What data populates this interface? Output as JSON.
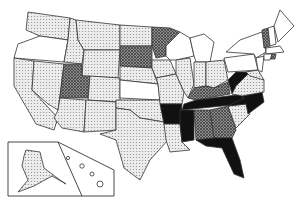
{
  "map": {
    "title": "",
    "legend": {
      "levels": [
        {
          "id": "none",
          "fill": "#ffffff"
        },
        {
          "id": "light",
          "fill": "url(#dots)"
        },
        {
          "id": "medium",
          "fill": "url(#hatch)"
        },
        {
          "id": "high",
          "fill": "#111111"
        }
      ]
    },
    "states": [
      {
        "id": "WA",
        "level": "light",
        "points": "28,12 70,18 68,40 40,36 26,30"
      },
      {
        "id": "OR",
        "level": "none",
        "points": "18,44 40,36 68,40 64,62 14,58"
      },
      {
        "id": "CA",
        "level": "light",
        "points": "14,58 34,61 32,90 58,118 54,130 36,124 14,86"
      },
      {
        "id": "NV",
        "level": "light",
        "points": "34,61 64,64 58,110 48,104 32,90"
      },
      {
        "id": "ID",
        "level": "light",
        "points": "70,18 76,20 78,40 84,50 82,64 64,62 68,40"
      },
      {
        "id": "MT",
        "level": "light",
        "points": "76,20 120,25 120,50 84,50 78,40"
      },
      {
        "id": "WY",
        "level": "light",
        "points": "84,50 120,50 118,78 82,76"
      },
      {
        "id": "UT",
        "level": "medium",
        "points": "64,64 82,64 82,76 90,76 88,98 60,98"
      },
      {
        "id": "CO",
        "level": "light",
        "points": "90,76 120,78 120,102 88,100"
      },
      {
        "id": "AZ",
        "level": "light",
        "points": "60,98 86,100 84,132 62,128 54,118 58,110"
      },
      {
        "id": "NM",
        "level": "light",
        "points": "86,100 116,102 116,130 84,132"
      },
      {
        "id": "ND",
        "level": "light",
        "points": "120,25 152,27 152,46 120,46"
      },
      {
        "id": "SD",
        "level": "medium",
        "points": "120,46 152,46 152,68 120,66"
      },
      {
        "id": "NE",
        "level": "light",
        "points": "120,66 152,68 158,84 120,80"
      },
      {
        "id": "KS",
        "level": "none",
        "points": "120,80 158,84 160,100 120,98"
      },
      {
        "id": "OK",
        "level": "light",
        "points": "116,100 160,100 164,122 140,118 130,110 116,108"
      },
      {
        "id": "TX",
        "level": "light",
        "points": "116,108 130,110 140,118 164,122 168,140 150,160 140,180 124,168 116,140 100,134 116,130"
      },
      {
        "id": "MN",
        "level": "medium",
        "points": "152,27 170,28 180,32 166,46 166,56 156,58 152,46"
      },
      {
        "id": "IA",
        "level": "light",
        "points": "152,60 170,60 176,74 156,78 152,68"
      },
      {
        "id": "MO",
        "level": "light",
        "points": "156,78 176,74 184,92 182,104 160,104 158,84"
      },
      {
        "id": "AR",
        "level": "high",
        "points": "160,104 182,104 180,124 164,124"
      },
      {
        "id": "LA",
        "level": "light",
        "points": "164,124 180,124 182,142 190,150 170,152 166,140"
      },
      {
        "id": "WI",
        "level": "none",
        "points": "166,46 180,32 190,38 194,56 176,60 170,60 166,56"
      },
      {
        "id": "IL",
        "level": "light",
        "points": "176,60 190,58 194,84 188,98 184,92 176,74"
      },
      {
        "id": "MI",
        "level": "none",
        "points": "190,38 204,34 214,42 210,62 196,62 194,56"
      },
      {
        "id": "IN",
        "level": "light",
        "points": "194,62 206,62 206,86 194,88 194,84"
      },
      {
        "id": "OH",
        "level": "light",
        "points": "206,62 224,60 228,80 214,88 206,86"
      },
      {
        "id": "KY",
        "level": "medium",
        "points": "188,98 194,88 206,86 214,88 228,82 230,94 196,100"
      },
      {
        "id": "TN",
        "level": "high",
        "points": "184,104 196,100 244,94 242,104 182,110"
      },
      {
        "id": "MS",
        "level": "high",
        "points": "180,110 194,110 194,140 182,142 180,124"
      },
      {
        "id": "AL",
        "level": "medium",
        "points": "194,110 210,110 214,138 196,140"
      },
      {
        "id": "GA",
        "level": "medium",
        "points": "210,110 228,106 236,130 232,138 214,138"
      },
      {
        "id": "FL",
        "level": "high",
        "points": "196,140 214,138 232,138 240,160 244,178 234,174 222,148 206,146"
      },
      {
        "id": "SC",
        "level": "light",
        "points": "228,106 246,104 250,114 236,128"
      },
      {
        "id": "NC",
        "level": "high",
        "points": "242,96 262,92 264,102 248,114 246,104 228,106 244,98"
      },
      {
        "id": "WV",
        "level": "high",
        "points": "228,80 236,72 250,72 244,90 232,94"
      },
      {
        "id": "VA",
        "level": "light",
        "points": "236,86 250,72 264,80 264,92 242,96 232,94"
      },
      {
        "id": "PA",
        "level": "none",
        "points": "224,58 254,54 258,70 228,72"
      },
      {
        "id": "NY",
        "level": "none",
        "points": "226,52 240,40 262,32 266,52 256,58 254,54"
      },
      {
        "id": "MD",
        "level": "light",
        "points": "246,72 258,70 264,80 250,76"
      },
      {
        "id": "NJ",
        "level": "none",
        "points": "256,58 264,56 262,72 258,70"
      },
      {
        "id": "VT",
        "level": "medium",
        "points": "262,30 268,28 270,46 264,48"
      },
      {
        "id": "NH",
        "level": "none",
        "points": "268,28 274,26 276,44 270,46"
      },
      {
        "id": "ME",
        "level": "none",
        "points": "274,26 280,10 294,26 278,42"
      },
      {
        "id": "MA",
        "level": "none",
        "points": "266,48 280,46 284,52 266,54"
      },
      {
        "id": "CT",
        "level": "none",
        "points": "264,54 272,54 270,60 264,60"
      },
      {
        "id": "RI",
        "level": "medium",
        "points": "272,54 276,54 275,59 271,59"
      }
    ],
    "inset": {
      "frame_points": "8,142 58,142 82,154 114,170 114,196 8,196",
      "alaska": {
        "id": "AK",
        "level": "light",
        "points": "26,150 40,152 44,168 60,180 66,184 52,176 34,186 18,192 28,180 22,166 24,156"
      },
      "hawaii": [
        {
          "cx": 68,
          "cy": 158,
          "r": 1.6
        },
        {
          "cx": 82,
          "cy": 166,
          "r": 2.2
        },
        {
          "cx": 92,
          "cy": 174,
          "r": 2
        },
        {
          "cx": 100,
          "cy": 184,
          "r": 3
        }
      ],
      "divider": "58,142 82,196"
    }
  }
}
